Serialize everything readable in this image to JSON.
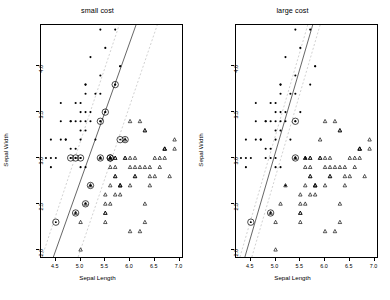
{
  "figure": {
    "xlabel": "Sepal Length",
    "ylabel": "Sepal Width",
    "xticks": [
      "4.5",
      "5.0",
      "5.5",
      "6.0",
      "6.5",
      "7.0"
    ],
    "yticks": [
      "2.0",
      "2.5",
      "3.0",
      "3.5",
      "4.0"
    ],
    "xlim": [
      4.2,
      7.05
    ],
    "ylim": [
      1.92,
      4.45
    ],
    "colors": {
      "axis": "#000000",
      "point": "#000000",
      "boundary": "#555555",
      "margin": "#cccccc"
    }
  },
  "chart_data": [
    {
      "type": "scatter",
      "title": "small cost",
      "xlabel": "Sepal Length",
      "ylabel": "Sepal Width",
      "xlim": [
        4.2,
        7.05
      ],
      "ylim": [
        1.92,
        4.45
      ],
      "grid": false,
      "legend": "none",
      "series": [
        {
          "name": "class-dot",
          "marker": "filled-dot",
          "points": [
            [
              5.4,
              4.4
            ],
            [
              5.2,
              4.1
            ],
            [
              5.5,
              4.2
            ],
            [
              5.1,
              3.8
            ],
            [
              4.8,
              3.4
            ],
            [
              5.8,
              4.0
            ],
            [
              5.7,
              4.4
            ],
            [
              5.4,
              3.9
            ],
            [
              5.1,
              3.7
            ],
            [
              4.6,
              3.6
            ],
            [
              5.1,
              3.5
            ],
            [
              4.8,
              3.4
            ],
            [
              5.0,
              3.6
            ],
            [
              5.2,
              3.5
            ],
            [
              5.3,
              3.7
            ],
            [
              5.0,
              3.4
            ],
            [
              5.1,
              3.4
            ],
            [
              5.4,
              3.4
            ],
            [
              4.6,
              3.4
            ],
            [
              4.4,
              3.2
            ],
            [
              4.7,
              3.2
            ],
            [
              4.8,
              3.1
            ],
            [
              4.9,
              3.1
            ],
            [
              5.0,
              3.2
            ],
            [
              5.1,
              3.3
            ],
            [
              4.4,
              3.0
            ],
            [
              4.3,
              3.0
            ],
            [
              4.5,
              3.0
            ],
            [
              4.8,
              3.0
            ],
            [
              4.9,
              3.0
            ],
            [
              5.0,
              3.0
            ],
            [
              5.4,
              3.0
            ],
            [
              5.6,
              3.0
            ],
            [
              4.4,
              2.9
            ],
            [
              5.1,
              2.9
            ],
            [
              5.0,
              2.9
            ],
            [
              5.2,
              2.7
            ],
            [
              4.9,
              3.6
            ],
            [
              4.7,
              3.2
            ],
            [
              5.0,
              3.5
            ],
            [
              5.5,
              3.5
            ],
            [
              5.7,
              3.8
            ],
            [
              5.1,
              3.8
            ],
            [
              4.6,
              3.2
            ],
            [
              5.3,
              3.2
            ],
            [
              5.0,
              3.3
            ],
            [
              4.9,
              3.4
            ],
            [
              5.4,
              3.7
            ],
            [
              5.8,
              4.0
            ],
            [
              5.2,
              3.4
            ]
          ]
        },
        {
          "name": "class-triangle",
          "marker": "triangle",
          "points": [
            [
              5.7,
              3.0
            ],
            [
              5.8,
              2.7
            ],
            [
              6.0,
              3.0
            ],
            [
              6.3,
              3.3
            ],
            [
              6.7,
              3.1
            ],
            [
              6.9,
              3.1
            ],
            [
              5.5,
              2.3
            ],
            [
              6.5,
              2.8
            ],
            [
              5.7,
              2.8
            ],
            [
              6.3,
              3.3
            ],
            [
              4.9,
              2.4
            ],
            [
              6.6,
              2.9
            ],
            [
              5.2,
              2.7
            ],
            [
              5.0,
              2.0
            ],
            [
              5.9,
              3.0
            ],
            [
              6.0,
              2.2
            ],
            [
              6.1,
              2.9
            ],
            [
              5.6,
              2.9
            ],
            [
              6.7,
              3.1
            ],
            [
              5.6,
              3.0
            ],
            [
              5.8,
              2.7
            ],
            [
              6.2,
              2.2
            ],
            [
              5.6,
              2.5
            ],
            [
              5.9,
              3.2
            ],
            [
              6.1,
              2.8
            ],
            [
              6.3,
              2.5
            ],
            [
              6.1,
              2.8
            ],
            [
              6.4,
              2.9
            ],
            [
              6.6,
              3.0
            ],
            [
              6.8,
              2.8
            ],
            [
              6.7,
              3.0
            ],
            [
              6.0,
              2.9
            ],
            [
              5.7,
              2.6
            ],
            [
              5.5,
              2.4
            ],
            [
              5.5,
              2.4
            ],
            [
              5.8,
              2.7
            ],
            [
              6.0,
              2.7
            ],
            [
              5.4,
              3.0
            ],
            [
              6.0,
              3.4
            ],
            [
              6.7,
              3.1
            ],
            [
              6.3,
              2.3
            ],
            [
              5.6,
              3.0
            ],
            [
              5.5,
              2.5
            ],
            [
              5.5,
              2.6
            ],
            [
              6.1,
              3.0
            ],
            [
              5.8,
              2.6
            ],
            [
              5.0,
              2.3
            ],
            [
              5.6,
              2.7
            ],
            [
              5.7,
              3.0
            ],
            [
              5.7,
              2.9
            ],
            [
              6.2,
              2.9
            ],
            [
              5.1,
              2.5
            ],
            [
              5.7,
              2.8
            ],
            [
              6.3,
              2.9
            ],
            [
              6.5,
              3.0
            ],
            [
              6.2,
              3.4
            ],
            [
              5.9,
              3.0
            ],
            [
              6.4,
              2.8
            ],
            [
              6.9,
              3.2
            ],
            [
              6.4,
              2.7
            ]
          ]
        },
        {
          "name": "support-vectors",
          "marker": "circled-dot",
          "points": [
            [
              5.7,
              3.8
            ],
            [
              5.5,
              3.5
            ],
            [
              5.4,
              3.4
            ],
            [
              4.8,
              3.0
            ],
            [
              4.9,
              3.0
            ],
            [
              5.0,
              3.0
            ],
            [
              5.4,
              3.0
            ],
            [
              5.6,
              3.0
            ],
            [
              5.9,
              3.2
            ],
            [
              5.8,
              3.2
            ],
            [
              5.2,
              2.7
            ],
            [
              5.1,
              2.5
            ],
            [
              4.9,
              2.4
            ],
            [
              4.5,
              2.3
            ],
            [
              5.6,
              3.0
            ]
          ]
        }
      ],
      "boundary": {
        "x1": 4.45,
        "y1": 1.92,
        "x2": 6.12,
        "y2": 4.45
      },
      "margins": [
        {
          "x1": 4.22,
          "y1": 1.92,
          "x2": 5.78,
          "y2": 4.45
        },
        {
          "x1": 4.95,
          "y1": 1.92,
          "x2": 6.55,
          "y2": 4.45
        }
      ]
    },
    {
      "type": "scatter",
      "title": "large cost",
      "xlabel": "Sepal Length",
      "ylabel": "Sepal Width",
      "xlim": [
        4.2,
        7.05
      ],
      "ylim": [
        1.92,
        4.45
      ],
      "grid": false,
      "legend": "none",
      "series": [
        {
          "name": "class-dot",
          "marker": "filled-dot",
          "points": [
            [
              5.4,
              4.4
            ],
            [
              5.2,
              4.1
            ],
            [
              5.5,
              4.2
            ],
            [
              5.1,
              3.8
            ],
            [
              4.8,
              3.4
            ],
            [
              5.8,
              4.0
            ],
            [
              5.7,
              4.4
            ],
            [
              5.4,
              3.9
            ],
            [
              5.1,
              3.7
            ],
            [
              4.6,
              3.6
            ],
            [
              5.1,
              3.5
            ],
            [
              4.8,
              3.4
            ],
            [
              5.0,
              3.6
            ],
            [
              5.2,
              3.5
            ],
            [
              5.3,
              3.7
            ],
            [
              5.0,
              3.4
            ],
            [
              5.1,
              3.4
            ],
            [
              5.4,
              3.4
            ],
            [
              4.6,
              3.4
            ],
            [
              4.4,
              3.2
            ],
            [
              4.7,
              3.2
            ],
            [
              4.8,
              3.1
            ],
            [
              4.9,
              3.1
            ],
            [
              5.0,
              3.2
            ],
            [
              5.1,
              3.3
            ],
            [
              4.4,
              3.0
            ],
            [
              4.3,
              3.0
            ],
            [
              4.5,
              3.0
            ],
            [
              4.8,
              3.0
            ],
            [
              4.9,
              3.0
            ],
            [
              5.0,
              3.0
            ],
            [
              5.4,
              3.0
            ],
            [
              5.6,
              3.0
            ],
            [
              4.4,
              2.9
            ],
            [
              5.1,
              2.9
            ],
            [
              5.0,
              2.9
            ],
            [
              5.2,
              2.7
            ],
            [
              4.9,
              3.6
            ],
            [
              4.7,
              3.2
            ],
            [
              5.0,
              3.5
            ],
            [
              5.5,
              3.5
            ],
            [
              5.7,
              3.8
            ],
            [
              5.1,
              3.8
            ],
            [
              4.6,
              3.2
            ],
            [
              5.3,
              3.2
            ],
            [
              5.0,
              3.3
            ],
            [
              4.9,
              3.4
            ],
            [
              5.4,
              3.7
            ],
            [
              5.8,
              4.0
            ],
            [
              5.2,
              3.4
            ]
          ]
        },
        {
          "name": "class-triangle",
          "marker": "triangle",
          "points": [
            [
              5.7,
              3.0
            ],
            [
              5.8,
              2.7
            ],
            [
              6.0,
              3.0
            ],
            [
              6.3,
              3.3
            ],
            [
              6.7,
              3.1
            ],
            [
              6.9,
              3.1
            ],
            [
              5.5,
              2.3
            ],
            [
              6.5,
              2.8
            ],
            [
              5.7,
              2.8
            ],
            [
              6.3,
              3.3
            ],
            [
              4.9,
              2.4
            ],
            [
              6.6,
              2.9
            ],
            [
              5.2,
              2.7
            ],
            [
              5.0,
              2.0
            ],
            [
              5.9,
              3.0
            ],
            [
              6.0,
              2.2
            ],
            [
              6.1,
              2.9
            ],
            [
              5.6,
              2.9
            ],
            [
              6.7,
              3.1
            ],
            [
              5.6,
              3.0
            ],
            [
              5.8,
              2.7
            ],
            [
              6.2,
              2.2
            ],
            [
              5.6,
              2.5
            ],
            [
              5.9,
              3.2
            ],
            [
              6.1,
              2.8
            ],
            [
              6.3,
              2.5
            ],
            [
              6.1,
              2.8
            ],
            [
              6.4,
              2.9
            ],
            [
              6.6,
              3.0
            ],
            [
              6.8,
              2.8
            ],
            [
              6.7,
              3.0
            ],
            [
              6.0,
              2.9
            ],
            [
              5.7,
              2.6
            ],
            [
              5.5,
              2.4
            ],
            [
              5.5,
              2.4
            ],
            [
              5.8,
              2.7
            ],
            [
              6.0,
              2.7
            ],
            [
              5.4,
              3.0
            ],
            [
              6.0,
              3.4
            ],
            [
              6.7,
              3.1
            ],
            [
              6.3,
              2.3
            ],
            [
              5.6,
              3.0
            ],
            [
              5.5,
              2.5
            ],
            [
              5.5,
              2.6
            ],
            [
              6.1,
              3.0
            ],
            [
              5.8,
              2.6
            ],
            [
              5.0,
              2.3
            ],
            [
              5.6,
              2.7
            ],
            [
              5.7,
              3.0
            ],
            [
              5.7,
              2.9
            ],
            [
              6.2,
              2.9
            ],
            [
              5.1,
              2.5
            ],
            [
              5.7,
              2.8
            ],
            [
              6.3,
              2.9
            ],
            [
              6.5,
              3.0
            ],
            [
              6.2,
              3.4
            ],
            [
              5.9,
              3.0
            ],
            [
              6.4,
              2.8
            ],
            [
              6.9,
              3.2
            ],
            [
              6.4,
              2.7
            ]
          ]
        },
        {
          "name": "support-vectors",
          "marker": "circled-dot",
          "points": [
            [
              5.4,
              3.4
            ],
            [
              5.4,
              3.0
            ],
            [
              4.9,
              2.4
            ],
            [
              4.5,
              2.3
            ]
          ]
        }
      ],
      "boundary": {
        "x1": 4.38,
        "y1": 1.92,
        "x2": 5.75,
        "y2": 4.45
      },
      "margins": [
        {
          "x1": 4.28,
          "y1": 1.92,
          "x2": 5.65,
          "y2": 4.45
        },
        {
          "x1": 4.52,
          "y1": 1.92,
          "x2": 5.9,
          "y2": 4.45
        }
      ]
    }
  ]
}
